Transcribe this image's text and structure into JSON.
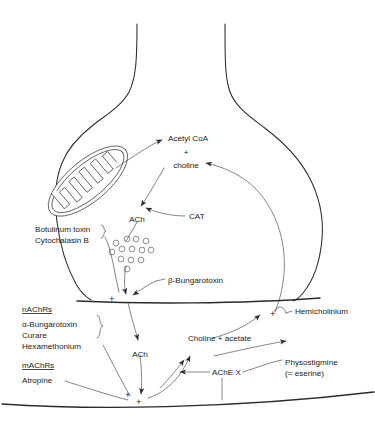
{
  "figure": {
    "ink_color": "#2b2b2b",
    "background": "#ffffff"
  },
  "labels": {
    "acetyl_coa": "Acetyl CoA",
    "plus_sign": "+",
    "choline": "choline",
    "cat": "CAT",
    "ach_terminal": "ACh",
    "ach_cleft": "ACh",
    "botulinum_toxin": "Botulinum toxin",
    "cytochalasin_b": "Cytochalasin B",
    "beta_bungarotoxin": "β-Bungarotoxin",
    "nachrs": "nAChRs",
    "alpha_bungarotoxin": "α-Bungarotoxin",
    "curare": "Curare",
    "hexamethonium": "Hexamethonium",
    "machrs": "mAChRs",
    "atropine": "Atropine",
    "hemicholinium": "Hemicholinium",
    "choline_acetate": "Choline + acetate",
    "ache_x": "AChE X",
    "physostigmine": "Physostigmine",
    "eserine": "(= eserine)"
  },
  "structures": {
    "nerve_terminal": "presynaptic-nerve-terminal",
    "mitochondrion": "mitochondrion",
    "vesicle_count": 13,
    "presynaptic_membrane": "presynaptic-membrane",
    "postsynaptic_membrane": "postsynaptic-membrane",
    "synaptic_cleft": "synaptic-cleft"
  },
  "markers": {
    "plus_release_site": "+",
    "plus_uptake_site": "+",
    "plus_postsynaptic_a": "+",
    "plus_postsynaptic_b": "+"
  }
}
